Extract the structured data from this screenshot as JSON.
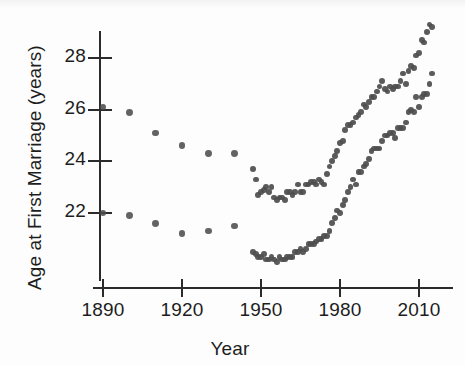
{
  "chart_data": {
    "type": "scatter",
    "title": "",
    "xlabel": "Year",
    "ylabel": "Age at First Marriage (years)",
    "xlim": [
      1884,
      2019
    ],
    "ylim": [
      19.9,
      30.0
    ],
    "xticks": [
      1890,
      1920,
      1950,
      1980,
      2010
    ],
    "xtick_labels": [
      "1890",
      "1920",
      "1950",
      "1980",
      "2010"
    ],
    "yticks": [
      22,
      24,
      26,
      28
    ],
    "ytick_labels": [
      "22",
      "24",
      "26",
      "28"
    ],
    "grid": false,
    "legend": "none",
    "marker": "filled-circle",
    "marker_color": "#4d4d4d",
    "axis_color": "#2b2b2b",
    "series": [
      {
        "name": "Men",
        "color": "#4d4d4d",
        "x": [
          1890,
          1900,
          1910,
          1920,
          1930,
          1940,
          1947,
          1948,
          1949,
          1950,
          1951,
          1952,
          1953,
          1954,
          1955,
          1956,
          1957,
          1958,
          1959,
          1960,
          1961,
          1962,
          1963,
          1964,
          1965,
          1966,
          1967,
          1968,
          1969,
          1970,
          1971,
          1972,
          1973,
          1974,
          1975,
          1976,
          1977,
          1978,
          1979,
          1980,
          1981,
          1982,
          1983,
          1984,
          1985,
          1986,
          1987,
          1988,
          1989,
          1990,
          1991,
          1992,
          1993,
          1994,
          1995,
          1996,
          1997,
          1998,
          1999,
          2000,
          2001,
          2002,
          2003,
          2004,
          2005,
          2006,
          2007,
          2008,
          2009,
          2010,
          2011,
          2012,
          2013,
          2014,
          2015
        ],
        "y": [
          26.1,
          25.9,
          25.1,
          24.6,
          24.3,
          24.3,
          23.7,
          23.3,
          22.7,
          22.8,
          22.9,
          23.0,
          22.8,
          23.0,
          22.6,
          22.5,
          22.6,
          22.6,
          22.5,
          22.8,
          22.8,
          22.7,
          22.8,
          23.1,
          22.8,
          22.8,
          23.1,
          23.1,
          23.2,
          23.2,
          23.1,
          23.3,
          23.2,
          23.1,
          23.5,
          23.8,
          24.0,
          24.2,
          24.4,
          24.7,
          24.8,
          25.2,
          25.4,
          25.4,
          25.5,
          25.7,
          25.8,
          25.9,
          26.2,
          26.1,
          26.3,
          26.5,
          26.5,
          26.7,
          26.9,
          27.1,
          26.8,
          26.7,
          26.9,
          26.8,
          26.9,
          26.9,
          27.1,
          27.4,
          27.0,
          27.5,
          27.7,
          27.6,
          28.1,
          28.2,
          28.7,
          28.6,
          29.0,
          29.3,
          29.2
        ]
      },
      {
        "name": "Women",
        "color": "#4d4d4d",
        "x": [
          1890,
          1900,
          1910,
          1920,
          1930,
          1940,
          1947,
          1948,
          1949,
          1950,
          1951,
          1952,
          1953,
          1954,
          1955,
          1956,
          1957,
          1958,
          1959,
          1960,
          1961,
          1962,
          1963,
          1964,
          1965,
          1966,
          1967,
          1968,
          1969,
          1970,
          1971,
          1972,
          1973,
          1974,
          1975,
          1976,
          1977,
          1978,
          1979,
          1980,
          1981,
          1982,
          1983,
          1984,
          1985,
          1986,
          1987,
          1988,
          1989,
          1990,
          1991,
          1992,
          1993,
          1994,
          1995,
          1996,
          1997,
          1998,
          1999,
          2000,
          2001,
          2002,
          2003,
          2004,
          2005,
          2006,
          2007,
          2008,
          2009,
          2010,
          2011,
          2012,
          2013,
          2014,
          2015
        ],
        "y": [
          22.0,
          21.9,
          21.6,
          21.2,
          21.3,
          21.5,
          20.5,
          20.4,
          20.3,
          20.3,
          20.4,
          20.2,
          20.2,
          20.3,
          20.2,
          20.1,
          20.3,
          20.2,
          20.2,
          20.3,
          20.3,
          20.3,
          20.5,
          20.5,
          20.6,
          20.5,
          20.6,
          20.8,
          20.8,
          20.8,
          20.9,
          21.0,
          21.0,
          21.1,
          21.1,
          21.3,
          21.6,
          21.8,
          22.1,
          22.0,
          22.3,
          22.5,
          22.8,
          23.0,
          23.3,
          23.1,
          23.6,
          23.6,
          23.8,
          23.9,
          24.1,
          24.4,
          24.5,
          24.5,
          24.5,
          24.8,
          25.0,
          25.0,
          25.1,
          25.1,
          24.9,
          25.3,
          25.3,
          25.3,
          25.5,
          25.9,
          26.0,
          25.9,
          26.5,
          26.1,
          26.5,
          26.6,
          26.6,
          27.0,
          27.4
        ]
      }
    ]
  },
  "axes": {
    "x_title": "Year",
    "y_title": "Age at First Marriage (years)"
  }
}
